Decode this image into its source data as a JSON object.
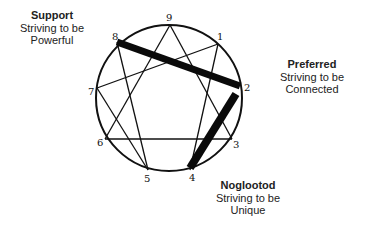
{
  "diagram": {
    "type": "enneagram",
    "points": [
      {
        "id": "9",
        "label": "9"
      },
      {
        "id": "1",
        "label": "1"
      },
      {
        "id": "2",
        "label": "2"
      },
      {
        "id": "3",
        "label": "3"
      },
      {
        "id": "4",
        "label": "4"
      },
      {
        "id": "5",
        "label": "5"
      },
      {
        "id": "6",
        "label": "6"
      },
      {
        "id": "7",
        "label": "7"
      },
      {
        "id": "8",
        "label": "8"
      }
    ],
    "highlighted_connections": [
      {
        "from": "8",
        "to": "2"
      },
      {
        "from": "2",
        "to": "4"
      }
    ]
  },
  "annotations": {
    "support": {
      "title": "Support",
      "line1": "Striving to be",
      "line2": "Powerful"
    },
    "preferred": {
      "title": "Preferred",
      "line1": "Striving to be",
      "line2": "Connected"
    },
    "noglootod": {
      "title": "Noglootod",
      "line1": "Striving to be",
      "line2": "Unique"
    }
  },
  "colors": {
    "stroke": "#111111",
    "text": "#222222",
    "background": "#ffffff"
  }
}
